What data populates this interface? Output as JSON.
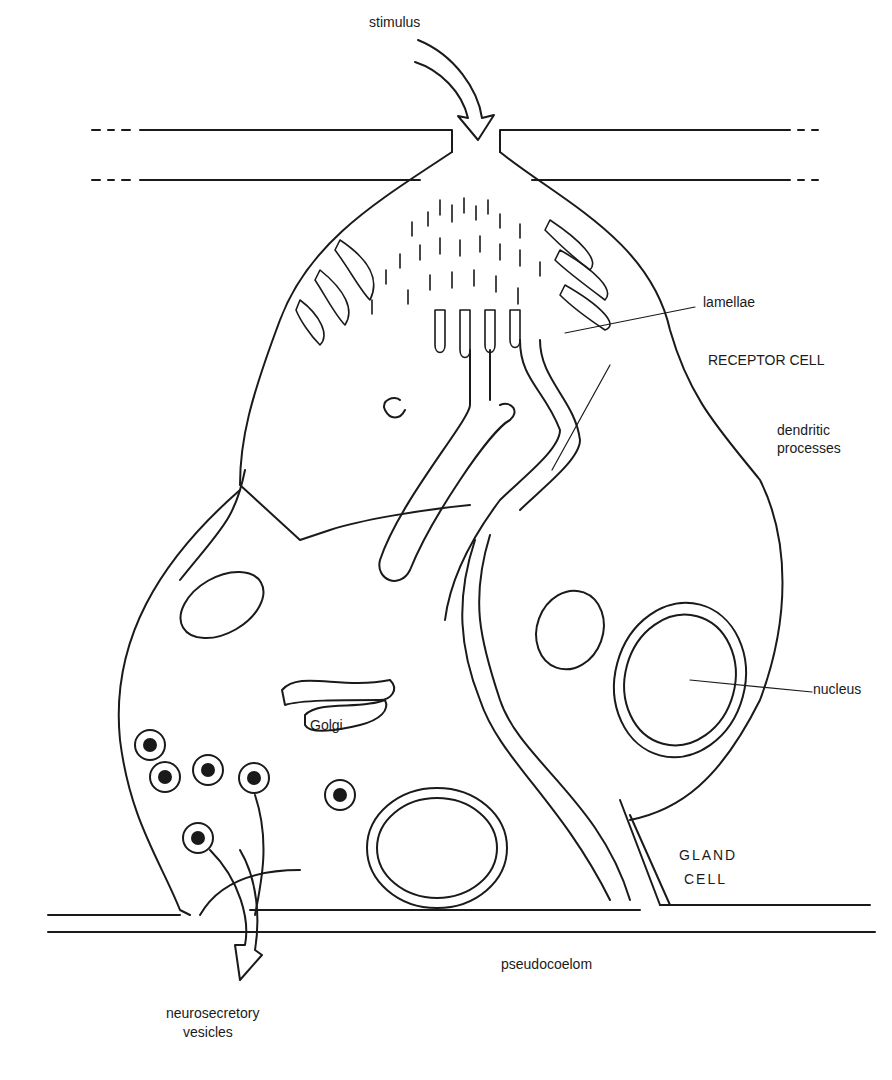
{
  "diagram": {
    "colors": {
      "ink": "#1a1a1a",
      "background": "#ffffff"
    },
    "labels": {
      "stimulus": "stimulus",
      "lamellae": "lamellae",
      "receptor_cell": "RECEPTOR CELL",
      "dendritic_1": "dendritic",
      "dendritic_2": "processes",
      "nucleus": "nucleus",
      "golgi": "Golgi",
      "gland_1": "GLAND",
      "gland_2": "CELL",
      "pseudocoelom": "pseudocoelom",
      "neuro_1": "neurosecretory",
      "neuro_2": "vesicles"
    }
  }
}
